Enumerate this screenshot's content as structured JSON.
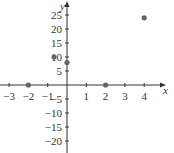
{
  "chart_data": {
    "type": "scatter",
    "title": "",
    "xlabel": "x",
    "ylabel": "y",
    "xlim": [
      -3.5,
      4.8
    ],
    "ylim": [
      -23,
      29
    ],
    "x_ticks": [
      -3,
      -2,
      -1,
      1,
      2,
      3,
      4
    ],
    "x_tick_labels": [
      "−3",
      "−2",
      "−1",
      "1",
      "2",
      "3",
      "4"
    ],
    "y_ticks": [
      -20,
      -15,
      -10,
      -5,
      5,
      10,
      15,
      20,
      25
    ],
    "y_tick_labels": [
      "−20",
      "−15",
      "−10",
      "−5",
      "5",
      "10",
      "15",
      "20",
      "25"
    ],
    "grid": false,
    "series": [
      {
        "name": "points",
        "color": "#666666",
        "points": [
          {
            "x": -2,
            "y": 0
          },
          {
            "x": -0.67,
            "y": 10
          },
          {
            "x": 0,
            "y": 8
          },
          {
            "x": 2,
            "y": 0
          },
          {
            "x": 4,
            "y": 24
          }
        ]
      }
    ]
  },
  "colors": {
    "axis": "#333333",
    "point": "#666666"
  }
}
